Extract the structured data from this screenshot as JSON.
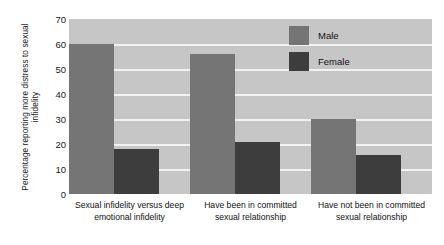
{
  "chart_data": {
    "type": "bar",
    "title": "",
    "xlabel": "",
    "ylabel": "Percentage reporting more distress to sexual infidelity",
    "ylim": [
      0,
      70
    ],
    "ytick_labels": [
      "70",
      "60",
      "50",
      "40",
      "30",
      "20",
      "10",
      "0"
    ],
    "ytick_values": [
      70,
      60,
      50,
      40,
      30,
      20,
      10,
      0
    ],
    "grid": true,
    "legend_position": "upper-right",
    "categories": [
      "Sexual infidelity versus deep emotional infidelity",
      "Have been in committed sexual relationship",
      "Have not been in committed sexual relationship"
    ],
    "series": [
      {
        "name": "Male",
        "color": "#757575",
        "values": [
          60,
          56,
          30
        ]
      },
      {
        "name": "Female",
        "color": "#3d3d3d",
        "values": [
          18,
          21,
          15.5
        ]
      }
    ],
    "plot_background": "#c6c6c6",
    "gridline_color": "#f2f2f2"
  }
}
